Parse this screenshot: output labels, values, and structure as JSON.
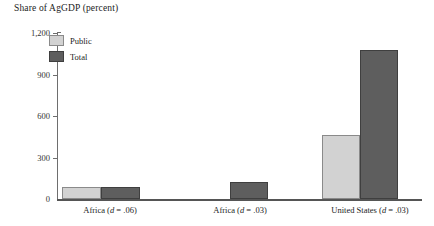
{
  "chart_data": {
    "type": "bar",
    "title": "Share of AgGDP (percent)",
    "xlabel": "",
    "ylabel": "",
    "ylim": [
      0,
      1200
    ],
    "yticks": [
      0,
      300,
      600,
      900,
      1200
    ],
    "ytick_labels": [
      "0",
      "300",
      "600",
      "900",
      "1,200"
    ],
    "grid": false,
    "legend_position": "inside-top-left",
    "categories": [
      "Africa (d = .06)",
      "Africa (d = .03)",
      "United States (d = .03)"
    ],
    "category_parts": [
      {
        "name": "Africa",
        "symbol": "d",
        "operator": "=",
        "value": ".06"
      },
      {
        "name": "Africa",
        "symbol": "d",
        "operator": "=",
        "value": ".03"
      },
      {
        "name": "United States",
        "symbol": "d",
        "operator": "=",
        "value": ".03"
      }
    ],
    "series": [
      {
        "name": "Public",
        "color": "#d2d2d2",
        "values": [
          90,
          0,
          460
        ]
      },
      {
        "name": "Total",
        "color": "#5e5e5e",
        "values": [
          90,
          123,
          1080
        ]
      }
    ]
  },
  "legend": {
    "items": [
      {
        "label": "Public",
        "color": "#d2d2d2"
      },
      {
        "label": "Total",
        "color": "#5e5e5e"
      }
    ]
  },
  "axis": {
    "y_labels": [
      "1,200",
      "900",
      "600",
      "300",
      "0"
    ]
  },
  "colors": {
    "public": "#d2d2d2",
    "total": "#5e5e5e",
    "axis": "#6e6e6e",
    "baseline": "#555555",
    "text": "#1c1c1c",
    "background": "#ffffff"
  }
}
